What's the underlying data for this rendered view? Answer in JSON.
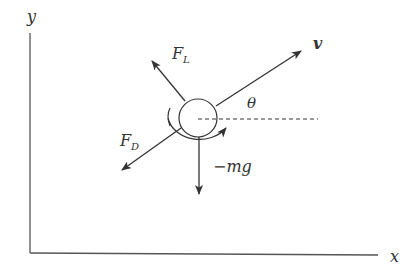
{
  "diagram": {
    "axes": {
      "x_label": "x",
      "y_label": "y"
    },
    "labels": {
      "velocity": "v",
      "lift": "F",
      "lift_sub": "L",
      "drag": "F",
      "drag_sub": "D",
      "angle": "θ",
      "gravity": "−mg"
    },
    "colors": {
      "stroke": "#333333",
      "background": "#ffffff"
    }
  }
}
